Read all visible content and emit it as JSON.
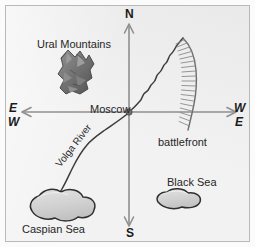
{
  "map": {
    "title": "Eastern Front map sketch",
    "background_color": "#f2f2f2",
    "frame_color": "#b9b9b9",
    "axis_color": "#8a8a8a",
    "ink_color": "#3c3c3c",
    "compass": {
      "north": "N",
      "south": "S",
      "left_upper": "E",
      "left_lower": "W",
      "right_upper": "W",
      "right_lower": "E"
    },
    "labels": {
      "ural_mountains": "Ural Mountains",
      "moscow": "Moscow",
      "battlefront": "battlefront",
      "volga_river": "Volga River",
      "caspian_sea": "Caspian Sea",
      "black_sea": "Black Sea"
    },
    "features": [
      {
        "name": "ural-mountains-icon",
        "type": "terrain-symbol",
        "label": "Ural Mountains"
      },
      {
        "name": "moscow-marker",
        "type": "city-dot",
        "label": "Moscow"
      },
      {
        "name": "battlefront-line",
        "type": "front-line-hatched",
        "label": "battlefront"
      },
      {
        "name": "volga-river-line",
        "type": "river",
        "label": "Volga River"
      },
      {
        "name": "caspian-sea-shape",
        "type": "water-body",
        "label": "Caspian Sea"
      },
      {
        "name": "black-sea-shape",
        "type": "water-body",
        "label": "Black Sea"
      }
    ]
  }
}
